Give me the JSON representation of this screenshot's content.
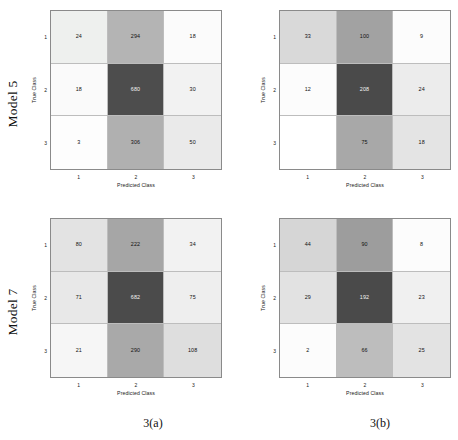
{
  "figure": {
    "row_labels": [
      "Model 5",
      "Model 7"
    ],
    "captions": [
      "3(a)",
      "3(b)"
    ]
  },
  "chart_data": [
    {
      "type": "heatmap",
      "name": "model-5-column-a",
      "title": "",
      "xlabel": "Predicted Class",
      "ylabel": "True Class",
      "categories": [
        "1",
        "2",
        "3"
      ],
      "xticklabels": [
        "1",
        "2",
        "3"
      ],
      "yticklabels": [
        "1",
        "2",
        "3"
      ],
      "grid": true,
      "legend": "none",
      "rows": [
        {
          "true_class": "1",
          "values": [
            24,
            294,
            18
          ]
        },
        {
          "true_class": "2",
          "values": [
            18,
            680,
            30
          ]
        },
        {
          "true_class": "3",
          "values": [
            3,
            306,
            50
          ]
        }
      ],
      "cell_shades": [
        [
          "#eef0ee",
          "#b4b4b4",
          "#fbfbfb"
        ],
        [
          "#fafafa",
          "#4d4d4d",
          "#f2f2f2"
        ],
        [
          "#fdfdfd",
          "#b0b0b0",
          "#eaeaea"
        ]
      ]
    },
    {
      "type": "heatmap",
      "name": "model-5-column-b",
      "title": "",
      "xlabel": "Predicted Class",
      "ylabel": "True Class",
      "categories": [
        "1",
        "2",
        "3"
      ],
      "xticklabels": [
        "1",
        "2",
        "3"
      ],
      "yticklabels": [
        "1",
        "2",
        "3"
      ],
      "grid": true,
      "legend": "none",
      "rows": [
        {
          "true_class": "1",
          "values": [
            33,
            100,
            9
          ]
        },
        {
          "true_class": "2",
          "values": [
            12,
            208,
            24
          ]
        },
        {
          "true_class": "3",
          "values": [
            "",
            75,
            18
          ]
        }
      ],
      "cell_shades": [
        [
          "#d9d9d9",
          "#a2a2a2",
          "#fcfcfc"
        ],
        [
          "#fcfcfc",
          "#4a4a4a",
          "#ececec"
        ],
        [
          "#ffffff",
          "#a8a8a8",
          "#e4e4e4"
        ]
      ]
    },
    {
      "type": "heatmap",
      "name": "model-7-column-a",
      "title": "",
      "xlabel": "Predicted Class",
      "ylabel": "True Class",
      "categories": [
        "1",
        "2",
        "3"
      ],
      "xticklabels": [
        "1",
        "2",
        "3"
      ],
      "yticklabels": [
        "1",
        "2",
        "3"
      ],
      "grid": true,
      "legend": "none",
      "rows": [
        {
          "true_class": "1",
          "values": [
            80,
            222,
            34
          ]
        },
        {
          "true_class": "2",
          "values": [
            71,
            682,
            75
          ]
        },
        {
          "true_class": "3",
          "values": [
            21,
            290,
            108
          ]
        }
      ],
      "cell_shades": [
        [
          "#e3e3e3",
          "#a6a6a6",
          "#f2f2f2"
        ],
        [
          "#e8e8e8",
          "#4b4b4b",
          "#eeeeee"
        ],
        [
          "#f6f6f6",
          "#a9a9a9",
          "#dedede"
        ]
      ]
    },
    {
      "type": "heatmap",
      "name": "model-7-column-b",
      "title": "",
      "xlabel": "Predicted Class",
      "ylabel": "True Class",
      "categories": [
        "1",
        "2",
        "3"
      ],
      "xticklabels": [
        "1",
        "2",
        "3"
      ],
      "yticklabels": [
        "1",
        "2",
        "3"
      ],
      "grid": true,
      "legend": "none",
      "rows": [
        {
          "true_class": "1",
          "values": [
            44,
            90,
            8
          ]
        },
        {
          "true_class": "2",
          "values": [
            29,
            192,
            23
          ]
        },
        {
          "true_class": "3",
          "values": [
            2,
            66,
            25
          ]
        }
      ],
      "cell_shades": [
        [
          "#d6d6d6",
          "#9d9d9d",
          "#fcfcfc"
        ],
        [
          "#e2e2e2",
          "#4a4a4a",
          "#f0f0f0"
        ],
        [
          "#fcfcfc",
          "#bdbdbd",
          "#e3e3e3"
        ]
      ]
    }
  ]
}
